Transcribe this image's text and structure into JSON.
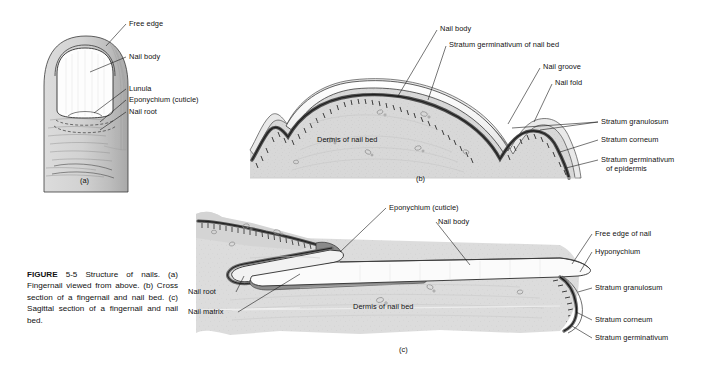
{
  "figure": {
    "number_bold": "FIGURE",
    "number": "5-5",
    "caption": "Structure of nails. (a) Fingernail viewed from above. (b) Cross section of a fingernail and nail bed. (c) Sagittal section of a fingernail and nail bed."
  },
  "panels": {
    "a": {
      "id": "(a)",
      "title": "Fingernail viewed from above",
      "labels": [
        {
          "key": "free_edge",
          "text": "Free edge"
        },
        {
          "key": "nail_body",
          "text": "Nail body"
        },
        {
          "key": "lunula",
          "text": "Lunula"
        },
        {
          "key": "eponychium",
          "text": "Eponychium (cuticle)"
        },
        {
          "key": "nail_root",
          "text": "Nail root"
        }
      ]
    },
    "b": {
      "id": "(b)",
      "title": "Cross section of a fingernail and nail bed",
      "labels": [
        {
          "key": "nail_body",
          "text": "Nail body"
        },
        {
          "key": "stratum_germ_nail_bed",
          "text": "Stratum germinativum of nail bed"
        },
        {
          "key": "nail_groove",
          "text": "Nail groove"
        },
        {
          "key": "nail_fold",
          "text": "Nail fold"
        },
        {
          "key": "stratum_granulosum",
          "text": "Stratum granulosum"
        },
        {
          "key": "stratum_corneum",
          "text": "Stratum corneum"
        },
        {
          "key": "stratum_germ_epidermis_l1",
          "text": "Stratum germinativum"
        },
        {
          "key": "stratum_germ_epidermis_l2",
          "text": "of epidermis"
        },
        {
          "key": "dermis",
          "text": "Dermis of nail bed"
        }
      ]
    },
    "c": {
      "id": "(c)",
      "title": "Sagittal section of a fingernail and nail bed",
      "labels": [
        {
          "key": "eponychium",
          "text": "Eponychium (cuticle)"
        },
        {
          "key": "nail_body",
          "text": "Nail body"
        },
        {
          "key": "free_edge_of_nail",
          "text": "Free edge of nail"
        },
        {
          "key": "hyponychium",
          "text": "Hyponychium"
        },
        {
          "key": "stratum_granulosum",
          "text": "Stratum granulosum"
        },
        {
          "key": "stratum_corneum",
          "text": "Stratum corneum"
        },
        {
          "key": "stratum_germinativum",
          "text": "Stratum germinativum"
        },
        {
          "key": "nail_root",
          "text": "Nail root"
        },
        {
          "key": "nail_matrix",
          "text": "Nail matrix"
        },
        {
          "key": "dermis",
          "text": "Dermis of nail bed"
        }
      ]
    }
  },
  "colors": {
    "background": "#ffffff",
    "ink": "#111111",
    "skin_light": "#d9d9d9",
    "skin_mid": "#c9c9c9",
    "skin_dark": "#b5b5b5",
    "dermis": "#d8d8d8",
    "nail_plate": "#fbfbfb",
    "germinativum_dark": "#595959",
    "matrix_dark": "#8d8d8d",
    "outline": "#2a2a2a"
  }
}
